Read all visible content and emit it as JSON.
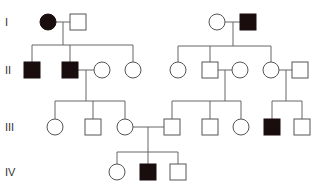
{
  "diagram": {
    "type": "pedigree",
    "colors": {
      "affected": "#1a0d0d",
      "unaffected": "#ffffff",
      "line": "#666666"
    },
    "generations": [
      {
        "label": "I",
        "y": 22
      },
      {
        "label": "II",
        "y": 70
      },
      {
        "label": "III",
        "y": 127
      },
      {
        "label": "IV",
        "y": 172
      }
    ],
    "individuals": [
      {
        "id": "I-1",
        "sex": "female",
        "affected": true,
        "x": 48,
        "y": 22
      },
      {
        "id": "I-2",
        "sex": "male",
        "affected": false,
        "x": 78,
        "y": 22
      },
      {
        "id": "I-3",
        "sex": "female",
        "affected": false,
        "x": 217,
        "y": 22
      },
      {
        "id": "I-4",
        "sex": "male",
        "affected": true,
        "x": 248,
        "y": 22
      },
      {
        "id": "II-1",
        "sex": "male",
        "affected": true,
        "x": 32,
        "y": 70
      },
      {
        "id": "II-2",
        "sex": "male",
        "affected": true,
        "x": 70,
        "y": 70
      },
      {
        "id": "II-3",
        "sex": "female",
        "affected": false,
        "x": 102,
        "y": 70
      },
      {
        "id": "II-4",
        "sex": "female",
        "affected": false,
        "x": 133,
        "y": 70
      },
      {
        "id": "II-5",
        "sex": "female",
        "affected": false,
        "x": 178,
        "y": 70
      },
      {
        "id": "II-6",
        "sex": "male",
        "affected": false,
        "x": 210,
        "y": 70
      },
      {
        "id": "II-7",
        "sex": "female",
        "affected": false,
        "x": 240,
        "y": 70
      },
      {
        "id": "II-8",
        "sex": "female",
        "affected": false,
        "x": 271,
        "y": 70
      },
      {
        "id": "II-9",
        "sex": "male",
        "affected": false,
        "x": 300,
        "y": 70
      },
      {
        "id": "III-1",
        "sex": "female",
        "affected": false,
        "x": 55,
        "y": 127
      },
      {
        "id": "III-2",
        "sex": "male",
        "affected": false,
        "x": 93,
        "y": 127
      },
      {
        "id": "III-3",
        "sex": "female",
        "affected": false,
        "x": 125,
        "y": 127
      },
      {
        "id": "III-4",
        "sex": "male",
        "affected": false,
        "x": 172,
        "y": 127
      },
      {
        "id": "III-5",
        "sex": "male",
        "affected": false,
        "x": 210,
        "y": 127
      },
      {
        "id": "III-6",
        "sex": "female",
        "affected": false,
        "x": 241,
        "y": 127
      },
      {
        "id": "III-7",
        "sex": "male",
        "affected": true,
        "x": 272,
        "y": 127
      },
      {
        "id": "III-8",
        "sex": "male",
        "affected": false,
        "x": 302,
        "y": 127
      },
      {
        "id": "IV-1",
        "sex": "female",
        "affected": false,
        "x": 117,
        "y": 172
      },
      {
        "id": "IV-2",
        "sex": "male",
        "affected": true,
        "x": 148,
        "y": 172
      },
      {
        "id": "IV-3",
        "sex": "male",
        "affected": false,
        "x": 178,
        "y": 172
      }
    ],
    "lines": [
      [
        56,
        22,
        70,
        22
      ],
      [
        63,
        22,
        63,
        45
      ],
      [
        32,
        45,
        133,
        45
      ],
      [
        32,
        45,
        32,
        62
      ],
      [
        70,
        45,
        70,
        62
      ],
      [
        133,
        45,
        133,
        62
      ],
      [
        225,
        22,
        240,
        22
      ],
      [
        233,
        22,
        233,
        46
      ],
      [
        178,
        46,
        271,
        46
      ],
      [
        178,
        46,
        178,
        62
      ],
      [
        210,
        46,
        210,
        62
      ],
      [
        271,
        46,
        271,
        62
      ],
      [
        78,
        70,
        94,
        70
      ],
      [
        86,
        70,
        86,
        101
      ],
      [
        55,
        101,
        125,
        101
      ],
      [
        55,
        101,
        55,
        119
      ],
      [
        93,
        101,
        93,
        119
      ],
      [
        125,
        101,
        125,
        119
      ],
      [
        218,
        70,
        232,
        70
      ],
      [
        225,
        70,
        225,
        101
      ],
      [
        172,
        101,
        241,
        101
      ],
      [
        172,
        101,
        172,
        119
      ],
      [
        210,
        101,
        210,
        119
      ],
      [
        241,
        101,
        241,
        119
      ],
      [
        279,
        70,
        292,
        70
      ],
      [
        286,
        70,
        286,
        101
      ],
      [
        272,
        101,
        302,
        101
      ],
      [
        272,
        101,
        272,
        119
      ],
      [
        302,
        101,
        302,
        119
      ],
      [
        133,
        127,
        164,
        127
      ],
      [
        148,
        127,
        148,
        152
      ],
      [
        117,
        152,
        178,
        152
      ],
      [
        117,
        152,
        117,
        164
      ],
      [
        148,
        152,
        148,
        164
      ],
      [
        178,
        152,
        178,
        164
      ]
    ]
  }
}
